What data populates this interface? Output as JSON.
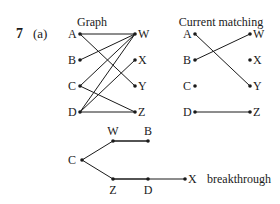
{
  "question": {
    "number": "7",
    "part": "(a)"
  },
  "graph": {
    "title": "Graph",
    "left_nodes": [
      "A",
      "B",
      "C",
      "D"
    ],
    "right_nodes": [
      "W",
      "X",
      "Y",
      "Z"
    ],
    "edges": [
      [
        "A",
        "W"
      ],
      [
        "A",
        "Y"
      ],
      [
        "B",
        "W"
      ],
      [
        "C",
        "W"
      ],
      [
        "C",
        "Z"
      ],
      [
        "D",
        "W"
      ],
      [
        "D",
        "X"
      ],
      [
        "D",
        "Z"
      ]
    ]
  },
  "matching": {
    "title": "Current matching",
    "left_nodes": [
      "A",
      "B",
      "C",
      "D"
    ],
    "right_nodes": [
      "W",
      "X",
      "Y",
      "Z"
    ],
    "edges": [
      [
        "A",
        "Y"
      ],
      [
        "B",
        "W"
      ],
      [
        "D",
        "Z"
      ]
    ]
  },
  "tree": {
    "root": "C",
    "nodes": [
      "C",
      "W",
      "B",
      "Z",
      "D",
      "X"
    ],
    "edges": [
      [
        "C",
        "W"
      ],
      [
        "W",
        "B"
      ],
      [
        "C",
        "Z"
      ],
      [
        "Z",
        "D"
      ],
      [
        "D",
        "X"
      ]
    ],
    "annotation": "breakthrough"
  }
}
